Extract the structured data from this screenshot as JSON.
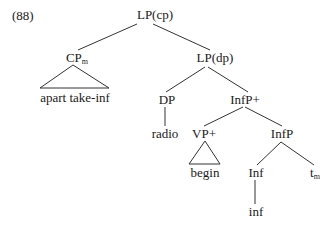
{
  "example_number": "(88)",
  "tree": {
    "root": {
      "label": "LP(cp)"
    },
    "cpm": {
      "label": "CP",
      "sub": "m"
    },
    "lpdp": {
      "label": "LP(dp)"
    },
    "cpm_leaf": {
      "label": "apart take-inf"
    },
    "dp": {
      "label": "DP"
    },
    "dp_leaf": {
      "label": "radio"
    },
    "infp_plus": {
      "label": "InfP+"
    },
    "vp_plus": {
      "label": "VP+"
    },
    "vp_leaf": {
      "label": "begin"
    },
    "infp": {
      "label": "InfP"
    },
    "inf": {
      "label": "Inf"
    },
    "inf_leaf": {
      "label": "inf"
    },
    "trace": {
      "label": "t",
      "sub": "m"
    }
  }
}
